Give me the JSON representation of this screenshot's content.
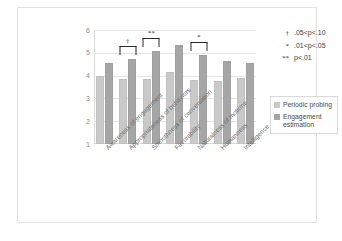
{
  "chart_data": {
    "type": "bar",
    "title": "",
    "xlabel": "",
    "ylabel": "",
    "ylim": [
      1,
      6
    ],
    "yticks": [
      "6",
      "5",
      "4",
      "3",
      "2",
      "1"
    ],
    "grid": true,
    "legend_position": "right",
    "categories": [
      "Awareness of engagement",
      "Appropriateness of behaviors",
      "Smoothness of conversation",
      "Favorability",
      "Naturalness of motions",
      "Humanness",
      "Intelligence"
    ],
    "series": [
      {
        "name": "Periodic probing",
        "color": "#c9c9c9",
        "values": [
          3.97,
          3.85,
          3.83,
          4.18,
          3.8,
          3.75,
          3.88
        ]
      },
      {
        "name": "Engagement estimation",
        "color": "#a6a6a6",
        "values": [
          4.57,
          4.72,
          5.08,
          5.35,
          4.9,
          4.63,
          4.55
        ]
      }
    ],
    "annotations": [
      {
        "category_index": 0,
        "mark": ""
      },
      {
        "category_index": 1,
        "mark": "†"
      },
      {
        "category_index": 2,
        "mark": "**"
      },
      {
        "category_index": 3,
        "mark": ""
      },
      {
        "category_index": 4,
        "mark": "*"
      },
      {
        "category_index": 5,
        "mark": ""
      },
      {
        "category_index": 6,
        "mark": ""
      }
    ],
    "significance_key": [
      {
        "symbol": "†",
        "text": ".05<p<.10"
      },
      {
        "symbol": "*",
        "text": ".01<p<.05"
      },
      {
        "symbol": "**",
        "text": "p<.01"
      }
    ]
  }
}
